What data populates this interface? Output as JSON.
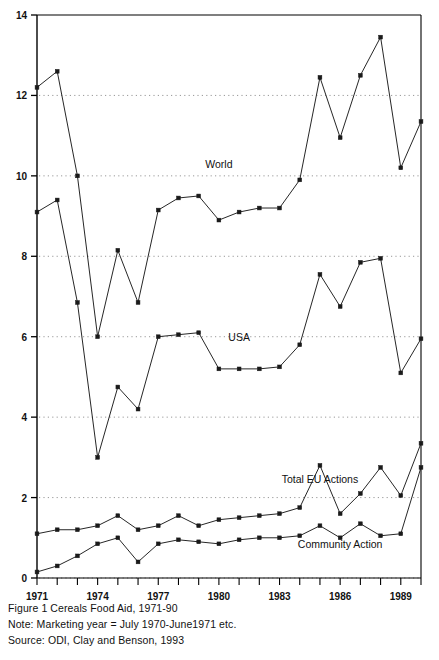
{
  "figure": {
    "caption": "Figure 1 Cereals Food Aid, 1971-90",
    "note": "Note: Marketing year = July 1970-June1971 etc.",
    "source": "Source: ODI, Clay and Benson, 1993"
  },
  "chart_data": {
    "type": "line",
    "title": "Figure 1 Cereals Food Aid, 1971-90",
    "xlabel": "",
    "ylabel": "",
    "xlim": [
      1971,
      1990
    ],
    "ylim": [
      0,
      14
    ],
    "yticks": [
      0,
      2,
      4,
      6,
      8,
      10,
      12,
      14
    ],
    "xticks": [
      1971,
      1974,
      1977,
      1980,
      1983,
      1986,
      1989
    ],
    "xtick_labels": [
      "1971",
      "1974",
      "1977",
      "1980",
      "1983",
      "1986",
      "1989"
    ],
    "ytick_labels": [
      "0",
      "2",
      "4",
      "6",
      "8",
      "10",
      "12",
      "14"
    ],
    "grid": "horizontal-dotted",
    "legend": "inline-annotations",
    "x": [
      1971,
      1972,
      1973,
      1974,
      1975,
      1976,
      1977,
      1978,
      1979,
      1980,
      1981,
      1982,
      1983,
      1984,
      1985,
      1986,
      1987,
      1988,
      1989,
      1990
    ],
    "series": [
      {
        "name": "World",
        "label": "World",
        "marker": "filled-square",
        "values": [
          12.2,
          12.6,
          10.0,
          6.0,
          8.15,
          6.85,
          9.15,
          9.45,
          9.5,
          8.9,
          9.1,
          9.2,
          9.2,
          9.9,
          12.45,
          10.95,
          12.5,
          13.45,
          10.2,
          11.35
        ]
      },
      {
        "name": "USA",
        "label": "USA",
        "marker": "filled-square",
        "values": [
          9.1,
          9.4,
          6.85,
          3.0,
          4.75,
          4.2,
          6.0,
          6.05,
          6.1,
          5.2,
          5.2,
          5.2,
          5.25,
          5.8,
          7.55,
          6.75,
          7.85,
          7.95,
          5.1,
          5.95
        ]
      },
      {
        "name": "Total EU Actions",
        "label": "Total EU Actions",
        "marker": "filled-square",
        "values": [
          1.1,
          1.2,
          1.2,
          1.3,
          1.55,
          1.2,
          1.3,
          1.55,
          1.3,
          1.45,
          1.5,
          1.55,
          1.6,
          1.75,
          2.8,
          1.6,
          2.1,
          2.75,
          2.05,
          3.35
        ]
      },
      {
        "name": "Community Action",
        "label": "Community Action",
        "marker": "filled-square",
        "values": [
          0.15,
          0.3,
          0.55,
          0.85,
          1.0,
          0.4,
          0.85,
          0.95,
          0.9,
          0.85,
          0.95,
          1.0,
          1.0,
          1.05,
          1.3,
          1.0,
          1.35,
          1.05,
          1.1,
          2.75
        ]
      }
    ],
    "annotations": [
      {
        "text": "World",
        "x": 1980,
        "y": 10.2
      },
      {
        "text": "USA",
        "x": 1981,
        "y": 5.9
      },
      {
        "text": "Total EU Actions",
        "x": 1985,
        "y": 2.35
      },
      {
        "text": "Community Action",
        "x": 1986,
        "y": 0.75
      }
    ]
  },
  "colors": {
    "line": "#1a1a1a",
    "grid": "#8d8d8d",
    "axis": "#000000",
    "background": "#ffffff"
  }
}
